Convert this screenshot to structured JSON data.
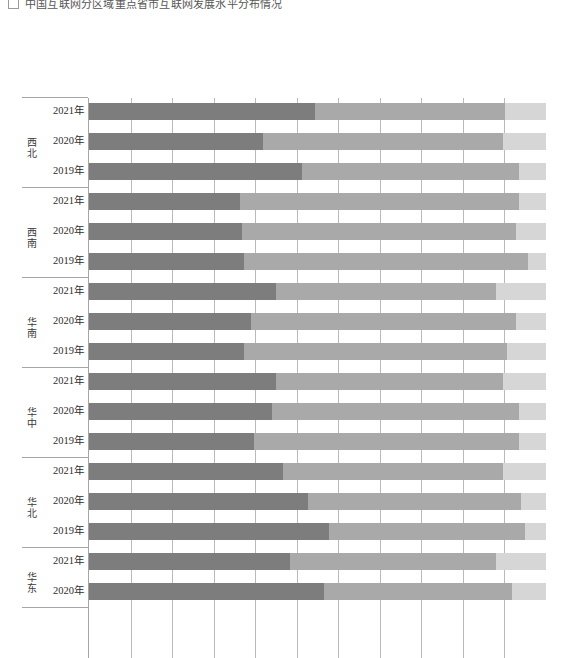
{
  "caption": {
    "checkbox": "checkbox-unchecked",
    "text": "中国互联网分区域重点省市互联网发展水平分布情况"
  },
  "chart_data": {
    "type": "bar",
    "orientation": "horizontal",
    "stacked": true,
    "normalized": true,
    "title": "",
    "xlabel": "",
    "ylabel": "",
    "xlim": [
      0,
      100
    ],
    "grid": true,
    "gridline_count": 11,
    "legend_position": "none",
    "colors": {
      "series1": "#7d7d7d",
      "series2": "#a9a9a9",
      "series3": "#d6d6d6",
      "gridline": "#b9b9b9",
      "axis": "#a5a5a5",
      "label": "#2e2e2e"
    },
    "series": [
      {
        "name": "series1",
        "color": "#7d7d7d"
      },
      {
        "name": "series2",
        "color": "#a9a9a9"
      },
      {
        "name": "series3",
        "color": "#d6d6d6"
      }
    ],
    "groups": [
      {
        "region": "西北",
        "rows": [
          {
            "category": "2021年",
            "values": [
              49.5,
              41.5,
              9.0
            ]
          },
          {
            "category": "2020年",
            "values": [
              38.0,
              52.5,
              9.5
            ]
          },
          {
            "category": "2019年",
            "values": [
              46.5,
              47.5,
              6.0
            ]
          }
        ]
      },
      {
        "region": "西南",
        "rows": [
          {
            "category": "2021年",
            "values": [
              33.0,
              61.0,
              6.0
            ]
          },
          {
            "category": "2020年",
            "values": [
              33.5,
              60.0,
              6.5
            ]
          },
          {
            "category": "2019年",
            "values": [
              34.0,
              62.0,
              4.0
            ]
          }
        ]
      },
      {
        "region": "华南",
        "rows": [
          {
            "category": "2021年",
            "values": [
              41.0,
              48.0,
              11.0
            ]
          },
          {
            "category": "2020年",
            "values": [
              35.5,
              58.0,
              6.5
            ]
          },
          {
            "category": "2019年",
            "values": [
              34.0,
              57.5,
              8.5
            ]
          }
        ]
      },
      {
        "region": "华中",
        "rows": [
          {
            "category": "2021年",
            "values": [
              41.0,
              49.5,
              9.5
            ]
          },
          {
            "category": "2020年",
            "values": [
              40.0,
              54.0,
              6.0
            ]
          },
          {
            "category": "2019年",
            "values": [
              36.0,
              58.0,
              6.0
            ]
          }
        ]
      },
      {
        "region": "华北",
        "rows": [
          {
            "category": "2021年",
            "values": [
              42.5,
              48.0,
              9.5
            ]
          },
          {
            "category": "2020年",
            "values": [
              48.0,
              46.5,
              5.5
            ]
          },
          {
            "category": "2019年",
            "values": [
              52.5,
              43.0,
              4.5
            ]
          }
        ]
      },
      {
        "region": "华东",
        "rows": [
          {
            "category": "2021年",
            "values": [
              44.0,
              45.0,
              11.0
            ]
          },
          {
            "category": "2020年",
            "values": [
              51.5,
              41.0,
              7.5
            ]
          }
        ]
      }
    ]
  }
}
